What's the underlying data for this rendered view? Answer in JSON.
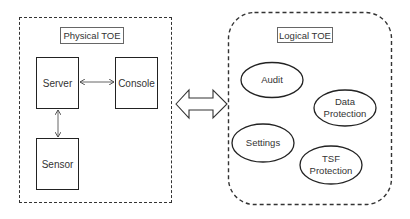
{
  "diagram": {
    "physical_toe": {
      "label": "Physical TOE",
      "nodes": [
        {
          "id": "server",
          "label": "Server"
        },
        {
          "id": "console",
          "label": "Console"
        },
        {
          "id": "sensor",
          "label": "Sensor"
        }
      ],
      "edges": [
        {
          "from": "server",
          "to": "console",
          "type": "bidirectional"
        },
        {
          "from": "server",
          "to": "sensor",
          "type": "bidirectional"
        }
      ]
    },
    "connector": {
      "type": "bidirectional-block-arrow",
      "between": [
        "Physical TOE",
        "Logical TOE"
      ]
    },
    "logical_toe": {
      "label": "Logical TOE",
      "nodes": [
        {
          "id": "audit",
          "label": "Audit"
        },
        {
          "id": "data_protection",
          "label_line1": "Data",
          "label_line2": "Protection"
        },
        {
          "id": "settings",
          "label": "Settings"
        },
        {
          "id": "tsf_protection",
          "label_line1": "TSF",
          "label_line2": "Protection"
        }
      ]
    },
    "colors": {
      "stroke": "#222222",
      "text": "#333333",
      "background": "#ffffff"
    }
  }
}
